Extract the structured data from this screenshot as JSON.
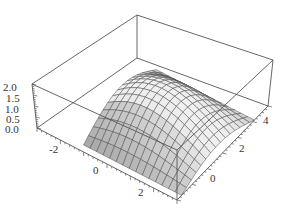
{
  "chart_data": {
    "type": "surface3d",
    "title": "",
    "x_axis": {
      "label": "",
      "ticks": [
        "-2",
        "0",
        "2"
      ],
      "range": [
        -3,
        3
      ]
    },
    "y_axis": {
      "label": "",
      "ticks": [
        "0",
        "2",
        "4"
      ],
      "range": [
        -1,
        5
      ]
    },
    "z_axis": {
      "label": "",
      "ticks": [
        "0.0",
        "0.5",
        "1.0",
        "1.5",
        "2.0"
      ],
      "range": [
        0,
        2
      ]
    },
    "surface": {
      "peak_value": 2.0,
      "mesh_lines_per_direction": 15,
      "shading": "grayscale"
    },
    "box": true,
    "grid": false,
    "legend": null
  },
  "labels": {
    "z": [
      "2.0",
      "1.5",
      "1.0",
      "0.5",
      "0.0"
    ],
    "x": [
      "-2",
      "0",
      "2"
    ],
    "y": [
      "0",
      "2",
      "4"
    ]
  }
}
